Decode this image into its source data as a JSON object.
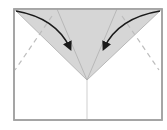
{
  "diagram": {
    "paper": {
      "x": 14,
      "y": 9,
      "width": 148,
      "height": 111,
      "fill": "#ffffff",
      "stroke": "#a0a0a0"
    },
    "flap": {
      "points": "14,9 162,9 87,80",
      "fill": "#d6d6d6",
      "stroke": "#b8b8b8"
    },
    "center_line": {
      "x": 87,
      "y1": 9,
      "y2": 120,
      "stroke": "#cfcfcf"
    },
    "inner_creases": [
      {
        "x1": 57,
        "y1": 9,
        "x2": 87,
        "y2": 80
      },
      {
        "x1": 117,
        "y1": 9,
        "x2": 87,
        "y2": 80
      }
    ],
    "dashed_fold_lines": [
      {
        "x1": 52,
        "y1": 16,
        "x2": 15,
        "y2": 70
      },
      {
        "x1": 122,
        "y1": 16,
        "x2": 159,
        "y2": 70
      }
    ],
    "arrows": [
      {
        "name": "left-fold-arrow",
        "path": "M16,11 Q56,18 70,48"
      },
      {
        "name": "right-fold-arrow",
        "path": "M160,11 Q118,18 104,48"
      }
    ],
    "colors": {
      "arrow": "#1a1a1a",
      "dash": "#bdbdbd",
      "crease": "#b0b0b0"
    }
  }
}
